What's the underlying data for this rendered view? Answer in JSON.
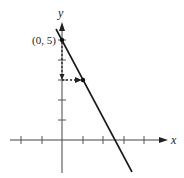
{
  "diagram": {
    "type": "line-graph",
    "equation_implied": "y = -2x + 5",
    "axes": {
      "x_label": "x",
      "y_label": "y",
      "x_ticks": [
        -2,
        -1,
        1,
        2,
        3,
        4
      ],
      "y_ticks": [
        1,
        2,
        3,
        4,
        5
      ]
    },
    "point_label": "(0, 5)",
    "points": [
      {
        "x": 0,
        "y": 5,
        "label": "(0, 5)"
      },
      {
        "x": 1,
        "y": 3
      }
    ],
    "slope_annotation": {
      "rise": -2,
      "run": 1,
      "style": "dashed-arrows"
    },
    "colors": {
      "line": "#1a1a1a",
      "axis": "#333333",
      "background": "#ffffff"
    }
  }
}
